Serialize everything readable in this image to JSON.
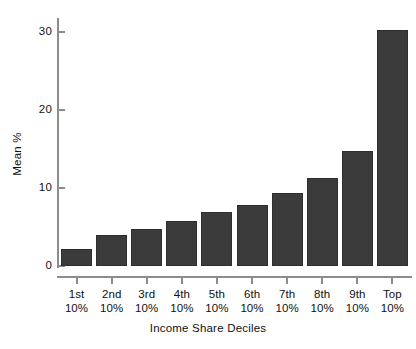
{
  "chart_data": {
    "type": "bar",
    "title": "",
    "subtitle": "",
    "xlabel": "Income Share Deciles",
    "ylabel": "Mean %",
    "categories": [
      "1st\n10%",
      "2nd\n10%",
      "3rd\n10%",
      "4th\n10%",
      "5th\n10%",
      "6th\n10%",
      "7th\n10%",
      "8th\n10%",
      "9th\n10%",
      "Top\n10%"
    ],
    "category_lines": [
      [
        "1st",
        "10%"
      ],
      [
        "2nd",
        "10%"
      ],
      [
        "3rd",
        "10%"
      ],
      [
        "4th",
        "10%"
      ],
      [
        "5th",
        "10%"
      ],
      [
        "6th",
        "10%"
      ],
      [
        "7th",
        "10%"
      ],
      [
        "8th",
        "10%"
      ],
      [
        "9th",
        "10%"
      ],
      [
        "Top",
        "10%"
      ]
    ],
    "values": [
      2.2,
      4.0,
      4.8,
      5.8,
      6.9,
      7.8,
      9.4,
      11.3,
      14.7,
      30.3
    ],
    "ylim": [
      0,
      31.5
    ],
    "yticks": [
      0,
      10,
      20,
      30
    ],
    "ytick_labels": [
      "0",
      "10",
      "20",
      "30"
    ],
    "grid": false,
    "legend": false,
    "legend_position": "none",
    "bar_color": "#3b3b3b",
    "axis_color": "#8c8c8c",
    "text_color": "#111111",
    "background_color": "#ffffff"
  },
  "axes": {
    "y_title": "Mean %",
    "x_title": "Income Share Deciles"
  }
}
